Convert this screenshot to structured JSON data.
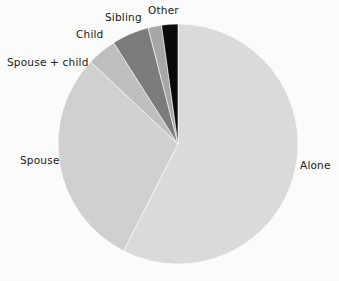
{
  "figure": {
    "background_color": "#fdfdfd",
    "label_color": "#1a1a1a"
  },
  "chart_data": {
    "type": "pie",
    "title": "",
    "subtitle": "",
    "xlabel": "",
    "ylabel": "",
    "legend_position": "none",
    "labels_position": "outside",
    "grid": false,
    "start_angle_deg": 0,
    "direction": "clockwise",
    "center": {
      "x": 178,
      "y": 144
    },
    "radius": 120,
    "categories": [
      "Alone",
      "Spouse",
      "Spouse + child",
      "Child",
      "Sibling",
      "Other"
    ],
    "values": [
      57.5,
      29.5,
      4.0,
      5.0,
      1.8,
      2.2
    ],
    "colors": [
      "#dcdcdc",
      "#d2d2d2",
      "#c0c0c0",
      "#7d7d7d",
      "#a8a8a8",
      "#0a0a0a"
    ],
    "slices": [
      {
        "label": "Alone",
        "value": 57.5,
        "color": "#dcdcdc",
        "start_deg": 0.0,
        "end_deg": 207.0
      },
      {
        "label": "Spouse",
        "value": 29.5,
        "color": "#d2d2d2",
        "start_deg": 207.0,
        "end_deg": 313.2
      },
      {
        "label": "Spouse + child",
        "value": 4.0,
        "color": "#c0c0c0",
        "start_deg": 313.2,
        "end_deg": 327.6
      },
      {
        "label": "Child",
        "value": 5.0,
        "color": "#7d7d7d",
        "start_deg": 327.6,
        "end_deg": 345.6
      },
      {
        "label": "Sibling",
        "value": 1.8,
        "color": "#a8a8a8",
        "start_deg": 345.6,
        "end_deg": 352.1
      },
      {
        "label": "Other",
        "value": 2.2,
        "color": "#0a0a0a",
        "start_deg": 352.1,
        "end_deg": 360.0
      }
    ]
  },
  "labels": {
    "alone": "Alone",
    "spouse": "Spouse",
    "spouse_child": "Spouse + child",
    "child": "Child",
    "sibling": "Sibling",
    "other": "Other"
  }
}
